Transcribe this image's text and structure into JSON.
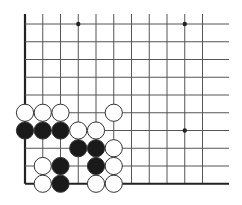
{
  "board": {
    "description": "Go problem diagram, lower-left corner section",
    "colors": {
      "background": "#ffffff",
      "line": "#555555",
      "edge": "#222222",
      "black_stone": "#1a1a1a",
      "white_stone": "#ffffff",
      "stone_outline": "#333333"
    },
    "grid": {
      "x_start": 25,
      "y_start": 24,
      "spacing": 17.75,
      "columns": 12,
      "rows": 10,
      "line_right_extent": 229,
      "line_top_extent": 14,
      "left_edge_thick": true,
      "bottom_edge_thick": true
    },
    "star_points": [
      {
        "col": 3,
        "row": 0
      },
      {
        "col": 9,
        "row": 0
      },
      {
        "col": 9,
        "row": 6
      }
    ],
    "stones": [
      {
        "color": "white",
        "col": 0,
        "row": 5
      },
      {
        "color": "white",
        "col": 1,
        "row": 5
      },
      {
        "color": "white",
        "col": 2,
        "row": 5
      },
      {
        "color": "white",
        "col": 5,
        "row": 5
      },
      {
        "color": "black",
        "col": 0,
        "row": 6
      },
      {
        "color": "black",
        "col": 1,
        "row": 6
      },
      {
        "color": "black",
        "col": 2,
        "row": 6
      },
      {
        "color": "white",
        "col": 3,
        "row": 6
      },
      {
        "color": "white",
        "col": 4,
        "row": 6
      },
      {
        "color": "black",
        "col": 3,
        "row": 7
      },
      {
        "color": "black",
        "col": 4,
        "row": 7
      },
      {
        "color": "white",
        "col": 5,
        "row": 7
      },
      {
        "color": "white",
        "col": 1,
        "row": 8
      },
      {
        "color": "black",
        "col": 2,
        "row": 8
      },
      {
        "color": "black",
        "col": 4,
        "row": 8
      },
      {
        "color": "white",
        "col": 5,
        "row": 8
      },
      {
        "color": "white",
        "col": 1,
        "row": 9
      },
      {
        "color": "black",
        "col": 2,
        "row": 9
      },
      {
        "color": "white",
        "col": 4,
        "row": 9
      },
      {
        "color": "white",
        "col": 5,
        "row": 9
      }
    ]
  }
}
